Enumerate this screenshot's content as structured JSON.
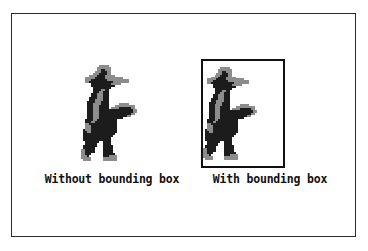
{
  "figure": {
    "border_color": "#2b2b2b",
    "background_color": "#ffffff"
  },
  "panels": [
    {
      "id": "without-bounding-box",
      "caption": "Without bounding box",
      "has_bounding_box": false,
      "sprite_name": "pixel-art-cowboy-sprite"
    },
    {
      "id": "with-bounding-box",
      "caption": "With bounding box",
      "has_bounding_box": true,
      "bounding_box_color": "#111111",
      "sprite_name": "pixel-art-cowboy-sprite"
    }
  ],
  "sprite": {
    "name": "pixel-art-cowboy-sprite",
    "description": "Pixel art cowboy walking and aiming a pistol",
    "body_color": "#1c1c1c",
    "accent_color": "#8c8c8c",
    "grid_width": 31,
    "grid_height": 52,
    "pixels": [
      "...............................",
      "...............................",
      "...............................",
      "..........22222................",
      ".........2222222...............",
      ".........2211222...............",
      "........22211122...............",
      ".......222111122...............",
      ".....2222111122222.............",
      "...2222211111222222222.........",
      "...2221111111122222222222......",
      "...2211111111111122222222......",
      "......111111111122222..........",
      "......111111111111............",
      ".......111111111..............",
      ".......11112211...............",
      ".......11122111...............",
      "......111222111...............",
      "......111222111...............",
      ".....1111222111...............",
      ".....1112222111...............",
      "....11112221111...............",
      "....11122221111.....22222.....",
      "....11122211111...2222222222..",
      "....11122211111.222211111122..",
      "....1112221111111111111111122.",
      "....1112221111111111111111122.",
      "....111222111111111111111122..",
      "....1112221111111111111122....",
      "....111222111111111111........",
      "...1111221111111111...........",
      "...1112211111111111...........",
      "...2211111111111111...........",
      "...2221111111111111...........",
      "...2221111111111111...........",
      "..12221111111111111...........",
      "..11221111111111111...........",
      "..1111111111111111............",
      "..111111111111111.............",
      "..11111111111111..............",
      "..11111111111111..............",
      "...1111111..1111..............",
      "...111111...1111..............",
      "..1111111...11111.............",
      "..111111....11111.............",
      ".2211111....11111.............",
      ".2211111....11111.............",
      ".22111......111111............",
      ".2221.......1112222...........",
      ".22222......2222222...........",
      "..2222......2222222...........",
      "...............................",
      "..............................."
    ]
  }
}
